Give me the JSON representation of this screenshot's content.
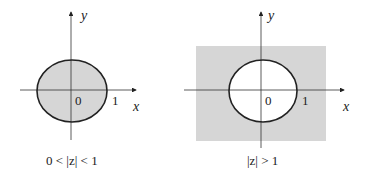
{
  "diagrams": [
    {
      "id": "left",
      "region": "punctured-disk",
      "caption": "0 < |z| < 1",
      "axis_labels": {
        "x": "x",
        "y": "y"
      },
      "origin_label": "0",
      "unit_label": "1",
      "shaded": "inside-circle",
      "colors": {
        "fill": "#d6d6d6",
        "stroke": "#222222"
      }
    },
    {
      "id": "right",
      "region": "exterior-of-unit-circle",
      "caption": "|z| > 1",
      "axis_labels": {
        "x": "x",
        "y": "y"
      },
      "origin_label": "0",
      "unit_label": "1",
      "shaded": "outside-circle",
      "colors": {
        "fill": "#d6d6d6",
        "stroke": "#222222"
      }
    }
  ]
}
